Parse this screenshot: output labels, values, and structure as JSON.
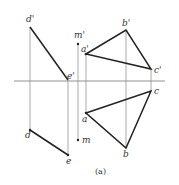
{
  "diagram": {
    "caption": "(a)",
    "labels": {
      "d_prime": "d'",
      "e_prime": "e'",
      "m_prime": "m'",
      "a_prime": "a'",
      "b_prime": "b'",
      "c_prime": "c'",
      "d": "d",
      "e": "e",
      "m": "m",
      "a": "a",
      "b": "b",
      "c": "c"
    },
    "colors": {
      "line": "#222222",
      "projector": "#888888"
    }
  }
}
